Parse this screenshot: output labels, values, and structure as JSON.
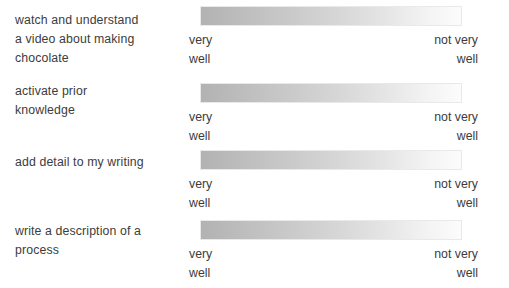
{
  "survey": {
    "scale": {
      "left_anchor_lines": [
        "very",
        "well"
      ],
      "right_anchor_lines": [
        "not very",
        "well"
      ],
      "gradient_start_color": "#b2b2b2",
      "gradient_end_color": "#fcfcfc",
      "border_color": "#e9e9e9"
    },
    "text_color": "#3c3c3c",
    "background_color": "#ffffff",
    "items": [
      {
        "prompt_lines": [
          "watch and understand",
          "a video about making",
          "chocolate"
        ],
        "left_anchor_lines": [
          "very",
          "well"
        ],
        "right_anchor_lines": [
          "not very",
          "well"
        ]
      },
      {
        "prompt_lines": [
          "activate prior",
          "knowledge"
        ],
        "left_anchor_lines": [
          "very",
          "well"
        ],
        "right_anchor_lines": [
          "not very",
          "well"
        ]
      },
      {
        "prompt_lines": [
          "add detail to my writing"
        ],
        "left_anchor_lines": [
          "very",
          "well"
        ],
        "right_anchor_lines": [
          "not very",
          "well"
        ]
      },
      {
        "prompt_lines": [
          "write a description of a",
          "process"
        ],
        "left_anchor_lines": [
          "very",
          "well"
        ],
        "right_anchor_lines": [
          "not very",
          "well"
        ]
      }
    ]
  }
}
